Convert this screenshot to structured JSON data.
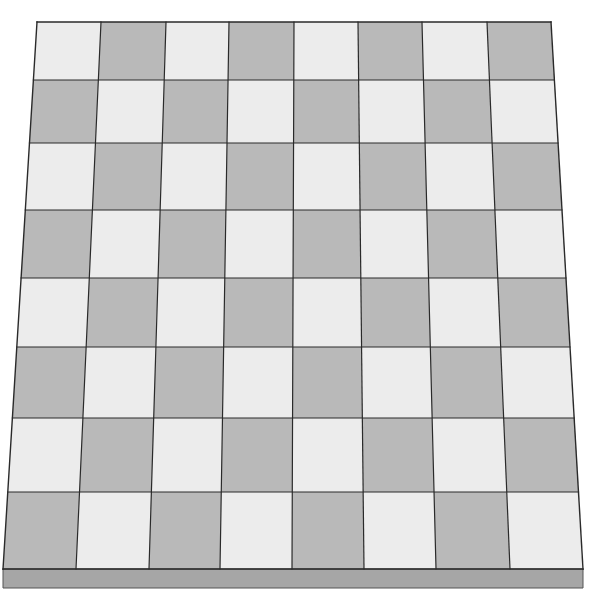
{
  "board": {
    "rows": 8,
    "cols": 8,
    "top_left_light": true,
    "colors": {
      "light": "#ececec",
      "dark": "#b9b9b9",
      "grid_line": "#2a2a2a",
      "base_edge": "#a6a6a6",
      "base_edge_line": "#555555",
      "background": "#ffffff"
    },
    "top_edge_x": [
      37,
      101,
      166,
      229,
      294,
      358,
      422,
      487,
      551
    ],
    "bottom_edge_x": [
      3,
      76,
      149,
      220,
      292,
      364,
      436,
      510,
      583
    ],
    "row_y": [
      22,
      80,
      143,
      210,
      278,
      347,
      418,
      492,
      569
    ],
    "base": {
      "top_y": 569,
      "bottom_y": 588,
      "left_x": 3,
      "right_x": 583
    }
  }
}
